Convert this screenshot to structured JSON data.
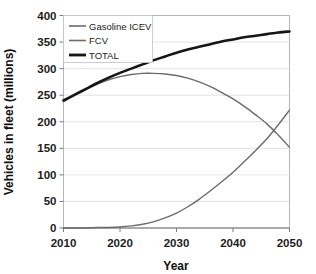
{
  "chart_data": {
    "type": "line",
    "title": "",
    "xlabel": "Year",
    "ylabel": "Vehicles in fleet (millions)",
    "xlim": [
      2010,
      2050
    ],
    "ylim": [
      0,
      400
    ],
    "xticks": [
      2010,
      2020,
      2030,
      2040,
      2050
    ],
    "yticks": [
      0,
      50,
      100,
      150,
      200,
      250,
      300,
      350,
      400
    ],
    "grid": "horizontal",
    "legend_position": "top-left",
    "x": [
      2010,
      2012,
      2014,
      2016,
      2018,
      2020,
      2022,
      2024,
      2026,
      2028,
      2030,
      2032,
      2034,
      2036,
      2038,
      2040,
      2042,
      2044,
      2046,
      2048,
      2050
    ],
    "series": [
      {
        "name": "Gasoline ICEV",
        "color": "#6b6b6b",
        "width": 1.4,
        "values": [
          238,
          250,
          261,
          271,
          279,
          285,
          289,
          291,
          291,
          290,
          287,
          282,
          275,
          266,
          255,
          243,
          229,
          213,
          196,
          175,
          152
        ]
      },
      {
        "name": "FCV",
        "color": "#6b6b6b",
        "width": 1.4,
        "values": [
          0,
          0,
          0,
          1,
          1,
          2,
          4,
          7,
          12,
          19,
          28,
          40,
          54,
          70,
          87,
          105,
          125,
          146,
          168,
          194,
          222
        ]
      },
      {
        "name": "TOTAL",
        "color": "#151515",
        "width": 2.6,
        "values": [
          240,
          251,
          262,
          273,
          283,
          292,
          300,
          308,
          316,
          323,
          330,
          336,
          341,
          346,
          351,
          355,
          359,
          362,
          365,
          368,
          370
        ]
      }
    ],
    "annotations": {
      "icev_peak_year": 2026,
      "icev_peak_value": 291,
      "crossover_year": 2047,
      "crossover_value": 180
    }
  },
  "axes": {
    "y_tick_labels": [
      "400",
      "350",
      "300",
      "250",
      "200",
      "150",
      "100",
      "50",
      "0"
    ],
    "x_tick_labels": [
      "2010",
      "2020",
      "2030",
      "2040",
      "2050"
    ],
    "x_axis_title": "Year",
    "y_axis_title": "Vehicles in fleet (millions)"
  },
  "legend": {
    "entries": [
      {
        "label": "Gasoline ICEV",
        "color": "#6b6b6b",
        "width": 1.6
      },
      {
        "label": "FCV",
        "color": "#6b6b6b",
        "width": 1.6
      },
      {
        "label": "TOTAL",
        "color": "#151515",
        "width": 2.8
      }
    ]
  }
}
